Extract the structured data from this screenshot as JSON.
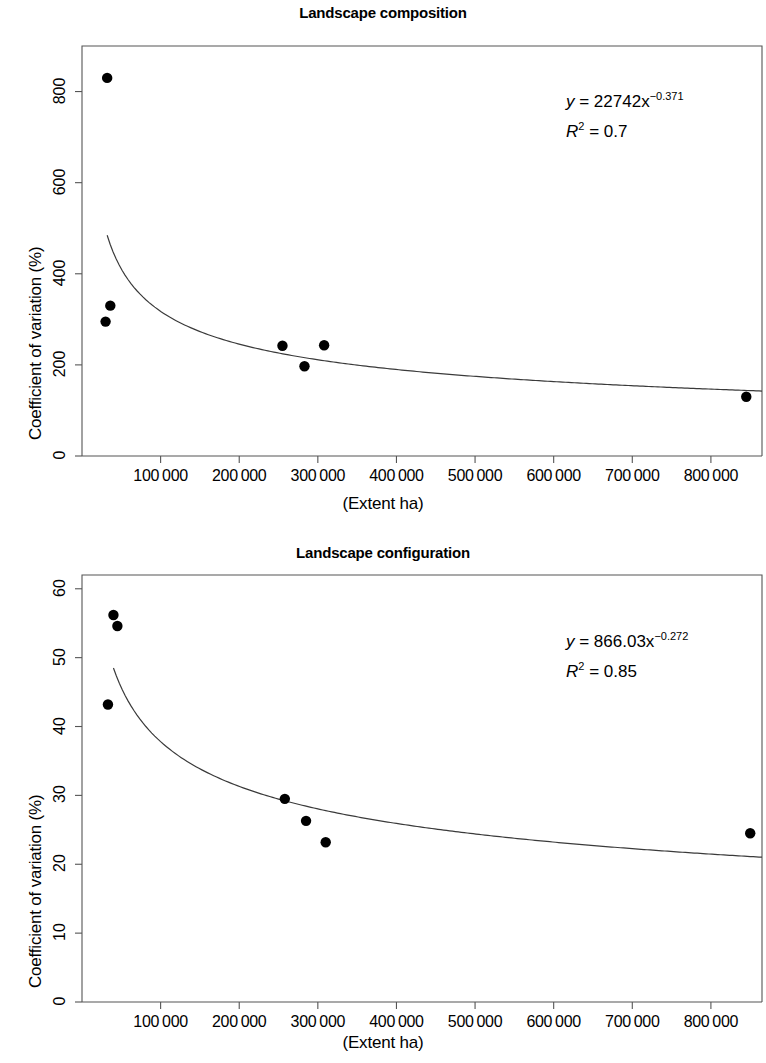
{
  "figure": {
    "xlabel": "(Extent ha)",
    "ylabel": "Coefficient of variation (%)"
  },
  "panels": [
    {
      "id": "composition",
      "title": "Landscape composition",
      "equation_y": "y",
      "equation_body": " = 22742x",
      "equation_exp": "−0.371",
      "r2_label": "R",
      "r2_sup": "2",
      "r2_value": " = 0.7"
    },
    {
      "id": "configuration",
      "title": "Landscape configuration",
      "equation_y": "y",
      "equation_body": " = 866.03x",
      "equation_exp": "−0.272",
      "r2_label": "R",
      "r2_sup": "2",
      "r2_value": " = 0.85"
    }
  ],
  "chart_data": [
    {
      "type": "scatter",
      "title": "Landscape composition",
      "xlabel": "(Extent ha)",
      "ylabel": "Coefficient of variation (%)",
      "xlim": [
        0,
        865000
      ],
      "ylim": [
        0,
        900
      ],
      "xticks": [
        100000,
        200000,
        300000,
        400000,
        500000,
        600000,
        700000,
        800000
      ],
      "xticklabels": [
        "100 000",
        "200 000",
        "300 000",
        "400 000",
        "500 000",
        "600 000",
        "700 000",
        "800 000"
      ],
      "yticks": [
        0,
        200,
        400,
        600,
        800
      ],
      "yticklabels": [
        "0",
        "200",
        "400",
        "600",
        "800"
      ],
      "grid": false,
      "legend": null,
      "points": [
        {
          "x": 32000,
          "y": 830
        },
        {
          "x": 36000,
          "y": 330
        },
        {
          "x": 30000,
          "y": 295
        },
        {
          "x": 255000,
          "y": 242
        },
        {
          "x": 283000,
          "y": 197
        },
        {
          "x": 308000,
          "y": 243
        },
        {
          "x": 845000,
          "y": 130
        }
      ],
      "fit": {
        "type": "power",
        "equation": "y = 22742x^-0.371",
        "coefficient": 22742,
        "exponent": -0.371,
        "r_squared": 0.7,
        "x_start": 32000,
        "x_end": 865000
      },
      "annotations": [
        "y = 22742x−0.371",
        "R2 = 0.7"
      ]
    },
    {
      "type": "scatter",
      "title": "Landscape configuration",
      "xlabel": "(Extent ha)",
      "ylabel": "Coefficient of variation (%)",
      "xlim": [
        0,
        865000
      ],
      "ylim": [
        0,
        62
      ],
      "xticks": [
        100000,
        200000,
        300000,
        400000,
        500000,
        600000,
        700000,
        800000
      ],
      "xticklabels": [
        "100 000",
        "200 000",
        "300 000",
        "400 000",
        "500 000",
        "600 000",
        "700 000",
        "800 000"
      ],
      "yticks": [
        0,
        10,
        20,
        30,
        40,
        50,
        60
      ],
      "yticklabels": [
        "0",
        "10",
        "20",
        "30",
        "40",
        "50",
        "60"
      ],
      "grid": false,
      "legend": null,
      "points": [
        {
          "x": 40000,
          "y": 56.2
        },
        {
          "x": 45000,
          "y": 54.6
        },
        {
          "x": 33000,
          "y": 43.2
        },
        {
          "x": 258000,
          "y": 29.5
        },
        {
          "x": 285000,
          "y": 26.3
        },
        {
          "x": 310000,
          "y": 23.2
        },
        {
          "x": 850000,
          "y": 24.5
        }
      ],
      "fit": {
        "type": "power",
        "equation": "y = 866.03x^-0.272",
        "coefficient": 866.03,
        "exponent": -0.272,
        "r_squared": 0.85,
        "x_start": 40000,
        "x_end": 865000
      },
      "annotations": [
        "y = 866.03x−0.272",
        "R2 = 0.85"
      ]
    }
  ]
}
